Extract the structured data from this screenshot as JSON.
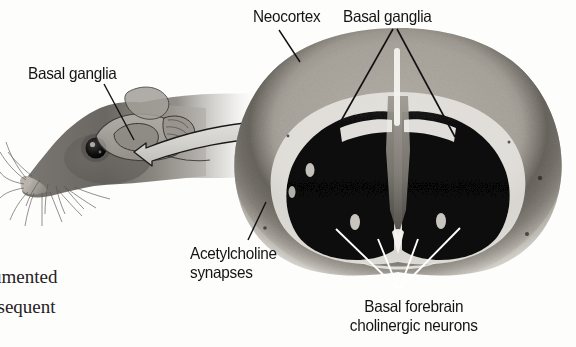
{
  "figure": {
    "background_color": "#fdfdfc",
    "width": 576,
    "height": 347
  },
  "labels": {
    "basal_ganglia_mouse": "Basal ganglia",
    "neocortex": "Neocortex",
    "basal_ganglia_brain": "Basal ganglia",
    "acetylcholine_line1": "Acetylcholine",
    "acetylcholine_line2": "synapses",
    "basal_forebrain_line1": "Basal forebrain",
    "basal_forebrain_line2": "cholinergic neurons"
  },
  "body_text": {
    "fragment_1": "umented",
    "fragment_2": "osequent"
  },
  "panels": {
    "left": {
      "name": "mouse-head-illustration",
      "description": "Grayscale side view of a mouse head facing left with whiskers, dark eye, and a translucent overlay of the brain showing basal ganglia"
    },
    "right": {
      "name": "coronal-brain-section",
      "description": "Grayscale coronal histological section of mouse brain with light neocortex ring, dark striatum lobes and ventricles"
    },
    "connector": {
      "name": "curved-double-arrow",
      "fill": "#d8d8d4",
      "stroke": "#1a1a1a"
    }
  },
  "colors": {
    "label_text": "#141414",
    "body_text": "#26211f",
    "leader_line_dark": "#111111",
    "leader_line_light": "#ffffff",
    "cortex_light": "#c9c5bd",
    "cortex_mid": "#8e8a82",
    "striatum_dark": "#0b0b0b",
    "mouse_fur": "#6f6c68"
  }
}
